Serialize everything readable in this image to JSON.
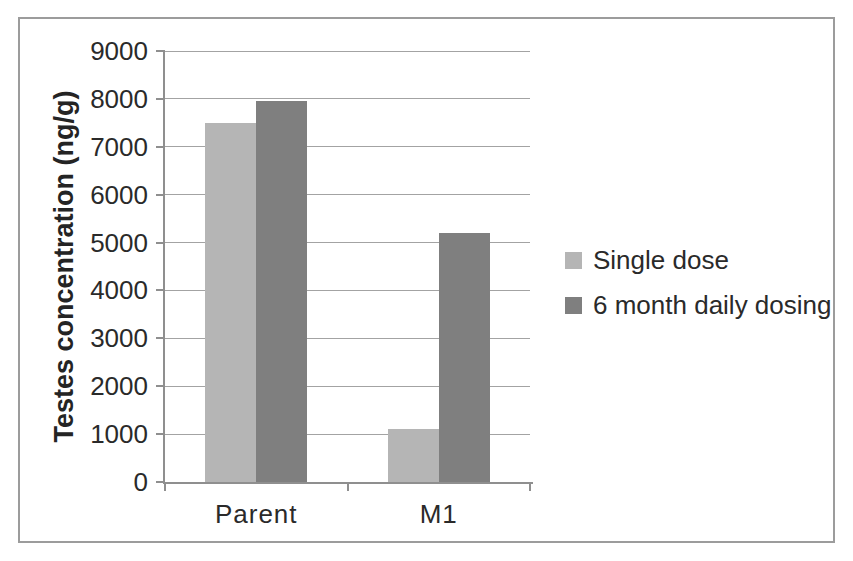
{
  "figure": {
    "background": "#ffffff",
    "border_color": "#9c9c9c",
    "axis_color": "#8f8f8f",
    "gridline_color": "#a3a3a3",
    "text_color": "#2a2a2a"
  },
  "chart_data": {
    "type": "bar",
    "title": "",
    "categories": [
      "Parent",
      "M1"
    ],
    "series": [
      {
        "name": "Single dose",
        "color": "#b5b5b5",
        "values": [
          7500,
          1100
        ]
      },
      {
        "name": "6 month daily dosing",
        "color": "#7f7f7f",
        "values": [
          7950,
          5200
        ]
      }
    ],
    "xlabel": "",
    "ylabel": "Testes concentration (ng/g)",
    "ylim": [
      0,
      9000
    ],
    "yticks": [
      0,
      1000,
      2000,
      3000,
      4000,
      5000,
      6000,
      7000,
      8000,
      9000
    ],
    "grid": "horizontal",
    "legend_position": "right",
    "bar_width_px": 51
  }
}
